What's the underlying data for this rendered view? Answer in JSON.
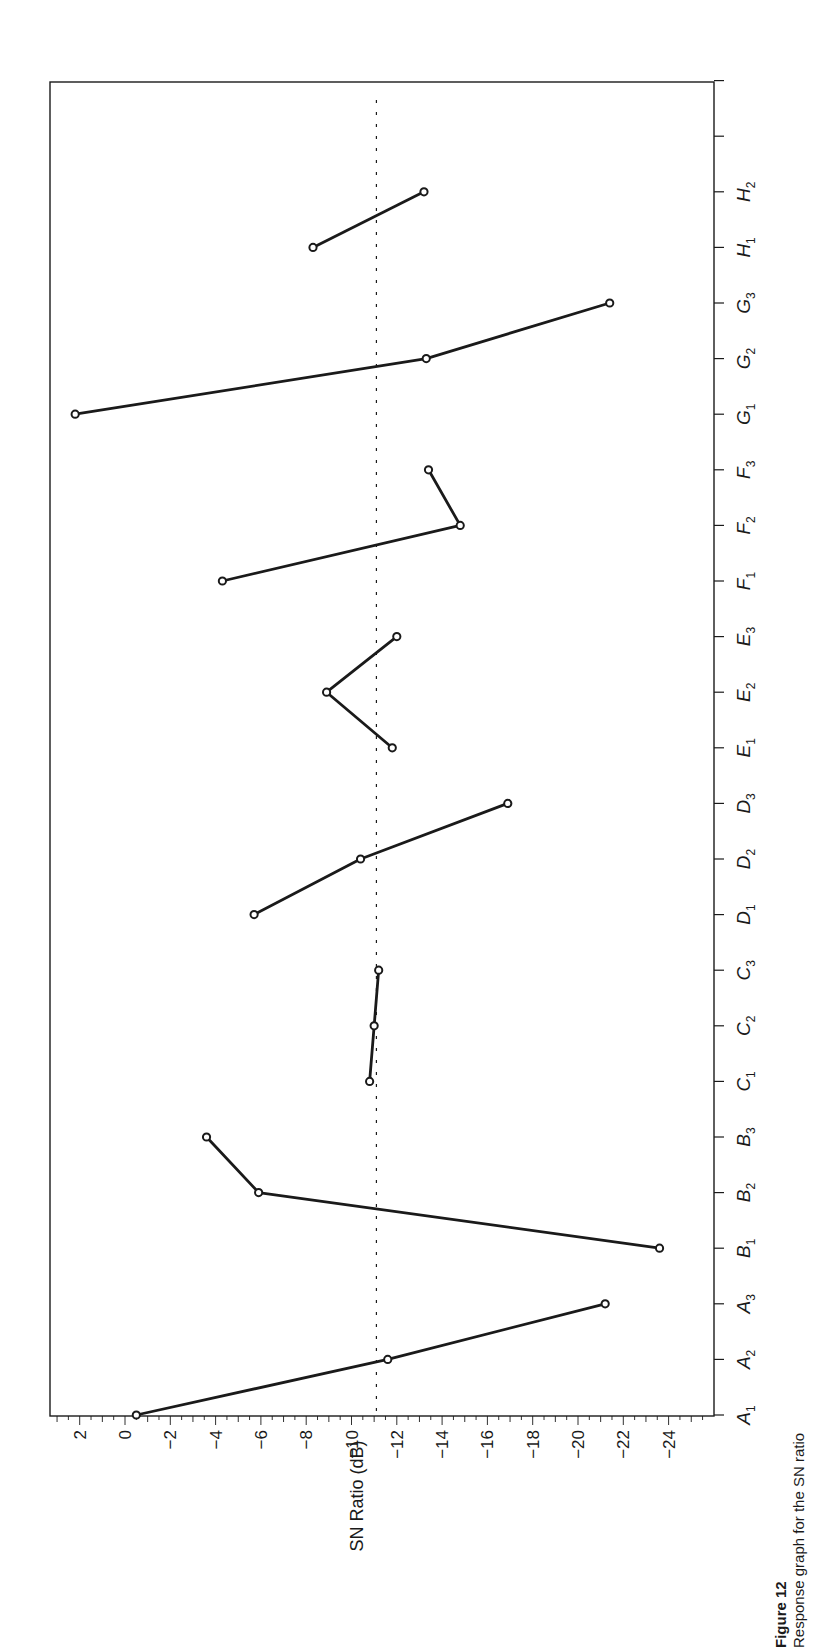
{
  "chart_data": {
    "type": "line",
    "orientation": "rotated-90-ccw",
    "title": "",
    "xlabel": "",
    "ylabel": "SN Ratio (dB)",
    "ylim": [
      2.5,
      -25
    ],
    "y_ticks": [
      2,
      0,
      -2,
      -4,
      -6,
      -8,
      -10,
      -12,
      -14,
      -16,
      -18,
      -20,
      -22,
      -24
    ],
    "categories": [
      "A1",
      "A2",
      "A3",
      "B1",
      "B2",
      "B3",
      "C1",
      "C2",
      "C3",
      "D1",
      "D2",
      "D3",
      "E1",
      "E2",
      "E3",
      "F1",
      "F2",
      "F3",
      "G1",
      "G2",
      "G3",
      "H1",
      "H2"
    ],
    "category_labels": [
      {
        "base": "A",
        "sub": "1"
      },
      {
        "base": "A",
        "sub": "2"
      },
      {
        "base": "A",
        "sub": "3"
      },
      {
        "base": "B",
        "sub": "1"
      },
      {
        "base": "B",
        "sub": "2"
      },
      {
        "base": "B",
        "sub": "3"
      },
      {
        "base": "C",
        "sub": "1"
      },
      {
        "base": "C",
        "sub": "2"
      },
      {
        "base": "C",
        "sub": "3"
      },
      {
        "base": "D",
        "sub": "1"
      },
      {
        "base": "D",
        "sub": "2"
      },
      {
        "base": "D",
        "sub": "3"
      },
      {
        "base": "E",
        "sub": "1"
      },
      {
        "base": "E",
        "sub": "2"
      },
      {
        "base": "E",
        "sub": "3"
      },
      {
        "base": "F",
        "sub": "1"
      },
      {
        "base": "F",
        "sub": "2"
      },
      {
        "base": "F",
        "sub": "3"
      },
      {
        "base": "G",
        "sub": "1"
      },
      {
        "base": "G",
        "sub": "2"
      },
      {
        "base": "G",
        "sub": "3"
      },
      {
        "base": "H",
        "sub": "1"
      },
      {
        "base": "H",
        "sub": "2"
      }
    ],
    "extra_blank_ticks": 2,
    "series": [
      {
        "name": "A",
        "points": [
          {
            "cat": "A1",
            "value": -0.5
          },
          {
            "cat": "A2",
            "value": -11.6
          },
          {
            "cat": "A3",
            "value": -21.2
          }
        ]
      },
      {
        "name": "B",
        "points": [
          {
            "cat": "B1",
            "value": -23.6
          },
          {
            "cat": "B2",
            "value": -5.9
          },
          {
            "cat": "B3",
            "value": -3.6
          }
        ]
      },
      {
        "name": "C",
        "points": [
          {
            "cat": "C1",
            "value": -10.8
          },
          {
            "cat": "C2",
            "value": -11.0
          },
          {
            "cat": "C3",
            "value": -11.2
          }
        ]
      },
      {
        "name": "D",
        "points": [
          {
            "cat": "D1",
            "value": -5.7
          },
          {
            "cat": "D2",
            "value": -10.4
          },
          {
            "cat": "D3",
            "value": -16.9
          }
        ]
      },
      {
        "name": "E",
        "points": [
          {
            "cat": "E1",
            "value": -11.8
          },
          {
            "cat": "E2",
            "value": -8.9
          },
          {
            "cat": "E3",
            "value": -12.0
          }
        ]
      },
      {
        "name": "F",
        "points": [
          {
            "cat": "F1",
            "value": -4.3
          },
          {
            "cat": "F2",
            "value": -14.8
          },
          {
            "cat": "F3",
            "value": -13.4
          }
        ]
      },
      {
        "name": "G",
        "points": [
          {
            "cat": "G1",
            "value": 2.2
          },
          {
            "cat": "G2",
            "value": -13.3
          },
          {
            "cat": "G3",
            "value": -21.4
          }
        ]
      },
      {
        "name": "H",
        "points": [
          {
            "cat": "H1",
            "value": -8.3
          },
          {
            "cat": "H2",
            "value": -13.2
          }
        ]
      }
    ],
    "reference_line": {
      "value": -11.1,
      "style": "dotted",
      "meaning": "overall mean"
    },
    "grid": false,
    "legend": null
  },
  "caption": {
    "figure_label": "Figure 12",
    "text": "Response graph for the SN ratio"
  },
  "colors": {
    "line": "#1a1a1a",
    "background": "#ffffff"
  }
}
